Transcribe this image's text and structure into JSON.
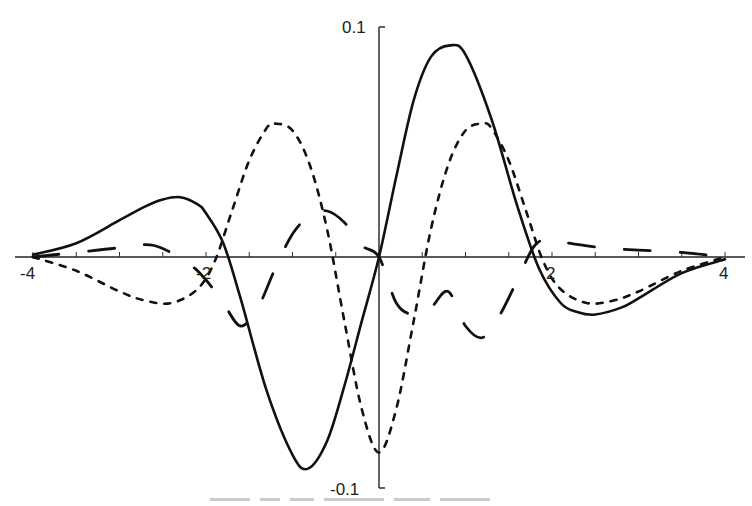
{
  "chart_data": {
    "type": "line",
    "title": "",
    "xlabel": "",
    "ylabel": "",
    "xlim": [
      -4,
      4
    ],
    "ylim": [
      -0.1,
      0.1
    ],
    "grid": false,
    "legend": null,
    "x_ticks": {
      "major_labeled": [
        -4,
        -2,
        2,
        4
      ],
      "labels": [
        "-4",
        "-2",
        "2",
        "4"
      ],
      "minor_step": 0.25
    },
    "y_ticks": {
      "labeled": [
        0.1,
        -0.1
      ],
      "labels": [
        "0.1",
        "-0.1"
      ]
    },
    "series": [
      {
        "name": "solid",
        "style": "solid",
        "x": [
          -4,
          -3.5,
          -3,
          -2.7,
          -2.5,
          -2.3,
          -2.1,
          -2.0,
          -1.8,
          -1.6,
          -1.3,
          -1.0,
          -0.82,
          -0.6,
          -0.4,
          -0.2,
          0,
          0.2,
          0.4,
          0.6,
          0.82,
          1.0,
          1.3,
          1.6,
          1.85,
          2.1,
          2.3,
          2.5,
          2.8,
          3.0,
          3.5,
          4.0
        ],
        "values": [
          0.001,
          0.006,
          0.016,
          0.022,
          0.025,
          0.026,
          0.023,
          0.019,
          0.006,
          -0.018,
          -0.058,
          -0.086,
          -0.092,
          -0.08,
          -0.056,
          -0.028,
          0,
          0.035,
          0.068,
          0.087,
          0.092,
          0.088,
          0.06,
          0.022,
          -0.005,
          -0.02,
          -0.024,
          -0.025,
          -0.022,
          -0.018,
          -0.007,
          -0.001
        ]
      },
      {
        "name": "short-dashed",
        "style": "dashed",
        "x": [
          -4,
          -3.5,
          -3,
          -2.7,
          -2.4,
          -2.1,
          -1.9,
          -1.7,
          -1.5,
          -1.3,
          -1.2,
          -1.0,
          -0.8,
          -0.6,
          -0.4,
          -0.2,
          0,
          0.2,
          0.4,
          0.6,
          0.8,
          1.0,
          1.2,
          1.3,
          1.5,
          1.7,
          1.9,
          2.1,
          2.4,
          2.7,
          3.0,
          3.5,
          4.0
        ],
        "values": [
          0,
          -0.006,
          -0.015,
          -0.019,
          -0.02,
          -0.014,
          -0.002,
          0.02,
          0.042,
          0.056,
          0.058,
          0.055,
          0.04,
          0.012,
          -0.028,
          -0.066,
          -0.085,
          -0.066,
          -0.028,
          0.012,
          0.04,
          0.055,
          0.058,
          0.056,
          0.042,
          0.02,
          -0.002,
          -0.014,
          -0.02,
          -0.019,
          -0.015,
          -0.006,
          0
        ]
      },
      {
        "name": "long-dashed",
        "style": "long-dash",
        "x": [
          -4,
          -3.5,
          -3.0,
          -2.6,
          -2.2,
          -2.0,
          -1.8,
          -1.6,
          -1.4,
          -1.2,
          -1.0,
          -0.8,
          -0.6,
          -0.4,
          -0.2,
          0,
          0.2,
          0.4,
          0.6,
          0.8,
          1.0,
          1.2,
          1.4,
          1.6,
          1.8,
          2.0,
          2.2,
          2.6,
          3.0,
          3.5,
          4.0
        ],
        "values": [
          0,
          0.002,
          0.004,
          0.005,
          -0.003,
          -0.01,
          -0.02,
          -0.03,
          -0.022,
          -0.005,
          0.01,
          0.018,
          0.02,
          0.015,
          0.005,
          0,
          -0.02,
          -0.025,
          -0.022,
          -0.015,
          -0.03,
          -0.035,
          -0.025,
          -0.01,
          0.005,
          0.008,
          0.006,
          0.004,
          0.003,
          0.002,
          0
        ]
      }
    ]
  },
  "axes": {
    "y_top_label": "0.1",
    "y_bottom_label": "-0.1",
    "x_labels": [
      "-4",
      "-2",
      "2",
      "4"
    ]
  }
}
